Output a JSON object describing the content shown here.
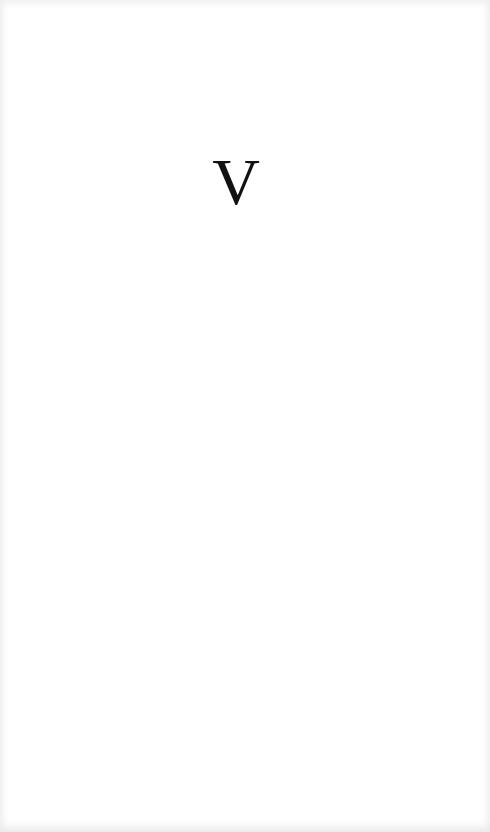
{
  "document": {
    "heading_numeral": "V",
    "colors": {
      "paper": "#ffffff",
      "ink": "#111111",
      "edge_shadow": "#e8e8e8"
    }
  }
}
